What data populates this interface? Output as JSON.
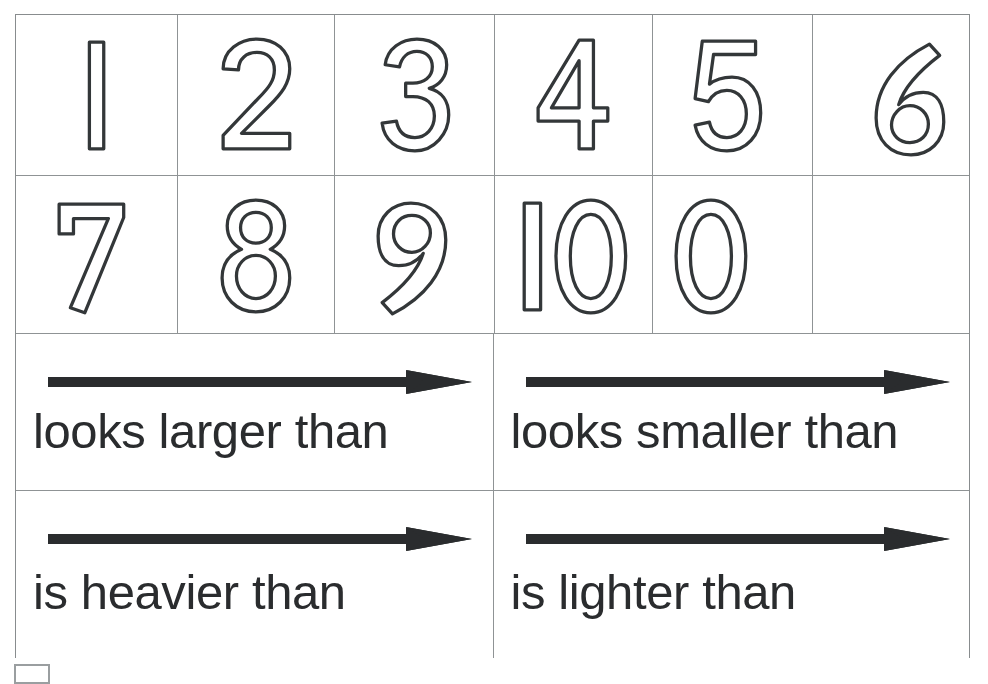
{
  "sheet": {
    "title": "Number and Comparison Cards",
    "background_color": "#ffffff",
    "grid_line_color": "#8f9395",
    "ink_color": "#2a2c2e",
    "digit_stroke_color": "#333739",
    "digit_fill_color": "#ffffff"
  },
  "number_grid": {
    "rows": [
      {
        "cells": [
          {
            "label": "1",
            "empty": false
          },
          {
            "label": "2",
            "empty": false
          },
          {
            "label": "3",
            "empty": false
          },
          {
            "label": "4",
            "empty": false
          },
          {
            "label": "5",
            "empty": false
          },
          {
            "label": "6",
            "empty": false
          }
        ]
      },
      {
        "cells": [
          {
            "label": "7",
            "empty": false
          },
          {
            "label": "8",
            "empty": false
          },
          {
            "label": "9",
            "empty": false
          },
          {
            "label": "10",
            "empty": false
          },
          {
            "label": "0",
            "empty": false
          },
          {
            "label": "",
            "empty": true
          }
        ]
      }
    ]
  },
  "phrase_grid": {
    "rows": [
      {
        "cells": [
          {
            "icon": "right-arrow-icon",
            "text": "looks larger than"
          },
          {
            "icon": "right-arrow-icon",
            "text": "looks smaller than"
          }
        ]
      },
      {
        "cells": [
          {
            "icon": "right-arrow-icon",
            "text": "is heavier than"
          },
          {
            "icon": "right-arrow-icon",
            "text": "is lighter than"
          }
        ]
      }
    ]
  },
  "crop_marker": {
    "name": "crop-marker"
  }
}
